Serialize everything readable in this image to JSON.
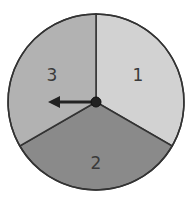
{
  "spinner": {
    "center": [
      96,
      102
    ],
    "radius": 88,
    "sections": [
      {
        "label": "1",
        "color": "#d2d2d2",
        "start_deg": 0,
        "end_deg": 120
      },
      {
        "label": "2",
        "color": "#8a8a8a",
        "start_deg": 120,
        "end_deg": 240
      },
      {
        "label": "3",
        "color": "#b2b2b2",
        "start_deg": 240,
        "end_deg": 360
      }
    ],
    "arrow_direction": "left",
    "outline_color": "#333333"
  }
}
